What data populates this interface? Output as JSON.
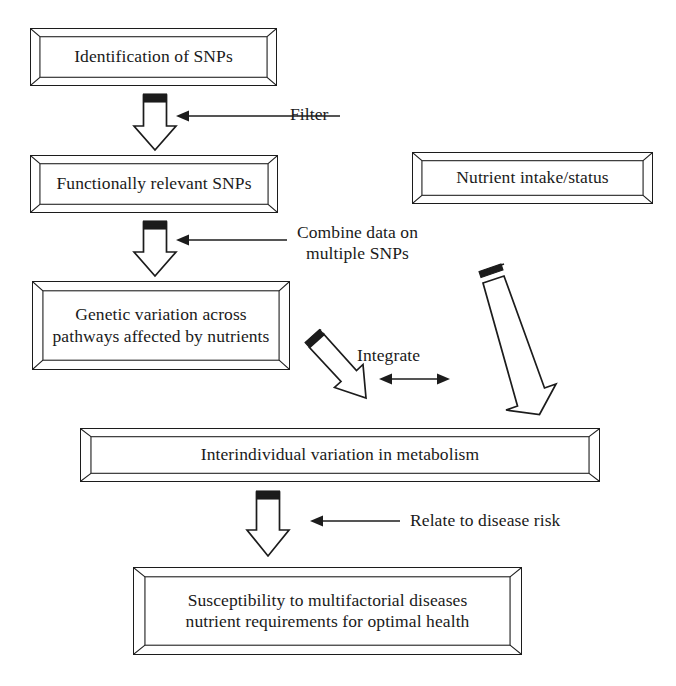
{
  "diagram": {
    "type": "flowchart",
    "background_color": "#ffffff",
    "line_color": "#1c1c1c",
    "text_color": "#1a1a1a",
    "boxes": [
      {
        "id": "identification-of-snps",
        "label": "Identification of SNPs"
      },
      {
        "id": "functionally-relevant-snps",
        "label": "Functionally relevant SNPs"
      },
      {
        "id": "nutrient-intake-status",
        "label": "Nutrient intake/status"
      },
      {
        "id": "genetic-variation",
        "label": "Genetic variation across\npathways affected by nutrients"
      },
      {
        "id": "interindividual-variation",
        "label": "Interindividual variation in metabolism"
      },
      {
        "id": "susceptibility",
        "label": "Susceptibility to multifactorial diseases\nnutrient requirements for optimal health"
      }
    ],
    "connector_labels": [
      {
        "id": "filter",
        "label": "Filter"
      },
      {
        "id": "combine-data",
        "label": "Combine data on\nmultiple SNPs"
      },
      {
        "id": "integrate",
        "label": "Integrate"
      },
      {
        "id": "relate-to-disease-risk",
        "label": "Relate to disease risk"
      }
    ],
    "arrows": [
      {
        "id": "arrow-identification-to-functional",
        "kind": "block-arrow-down"
      },
      {
        "id": "arrow-functional-to-genetic",
        "kind": "block-arrow-down"
      },
      {
        "id": "arrow-genetic-to-interindividual",
        "kind": "block-arrow-diagonal-down-right"
      },
      {
        "id": "arrow-nutrient-to-interindividual",
        "kind": "block-arrow-diagonal-down-left"
      },
      {
        "id": "arrow-interindividual-to-susceptibility",
        "kind": "block-arrow-down"
      },
      {
        "id": "arrow-filter-pointer",
        "kind": "thin-arrow-left"
      },
      {
        "id": "arrow-combine-pointer",
        "kind": "thin-arrow-left"
      },
      {
        "id": "arrow-relate-pointer",
        "kind": "thin-arrow-left"
      },
      {
        "id": "arrow-integrate-bidirectional",
        "kind": "thin-arrow-double-horizontal"
      }
    ]
  }
}
